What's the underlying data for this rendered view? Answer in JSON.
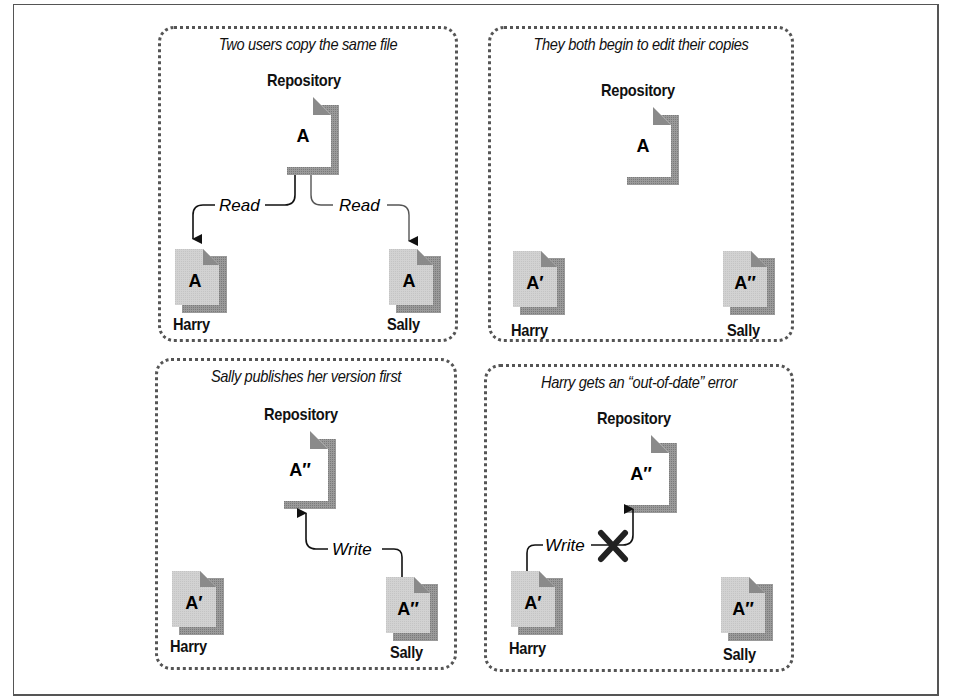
{
  "figure": {
    "colors": {
      "border": "#555555",
      "doc_repository_fill": "#ffffff",
      "doc_working_copy_fill": "#cfcfcf",
      "doc_corner": "#8a8a8a",
      "doc_shadow": "#8f8f8f",
      "error_mark": "#222222"
    }
  },
  "panels": [
    {
      "id": "panel-1",
      "caption": "Two users copy the same file",
      "repository": {
        "label": "Repository",
        "doc": "A"
      },
      "harry": {
        "label": "Harry",
        "doc": "A"
      },
      "sally": {
        "label": "Sally",
        "doc": "A"
      },
      "connectors": [
        {
          "from": "repository",
          "to": "harry",
          "label": "Read"
        },
        {
          "from": "repository",
          "to": "sally",
          "label": "Read"
        }
      ]
    },
    {
      "id": "panel-2",
      "caption": "They both begin to edit their copies",
      "repository": {
        "label": "Repository",
        "doc": "A"
      },
      "harry": {
        "label": "Harry",
        "doc": "A′"
      },
      "sally": {
        "label": "Sally",
        "doc": "A″"
      },
      "connectors": []
    },
    {
      "id": "panel-3",
      "caption": "Sally publishes her version first",
      "repository": {
        "label": "Repository",
        "doc": "A″"
      },
      "harry": {
        "label": "Harry",
        "doc": "A′"
      },
      "sally": {
        "label": "Sally",
        "doc": "A″"
      },
      "connectors": [
        {
          "from": "sally",
          "to": "repository",
          "label": "Write"
        }
      ]
    },
    {
      "id": "panel-4",
      "caption": "Harry gets an “out-of-date” error",
      "repository": {
        "label": "Repository",
        "doc": "A″"
      },
      "harry": {
        "label": "Harry",
        "doc": "A′"
      },
      "sally": {
        "label": "Sally",
        "doc": "A″"
      },
      "connectors": [
        {
          "from": "harry",
          "to": "repository",
          "label": "Write",
          "blocked": true,
          "error_icon": "x-mark"
        }
      ]
    }
  ]
}
